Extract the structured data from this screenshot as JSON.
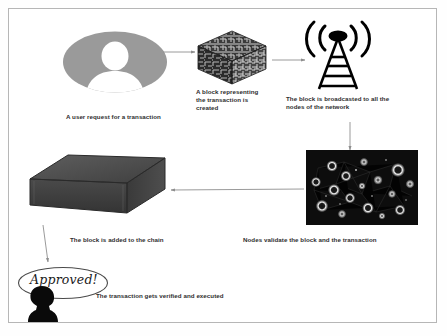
{
  "diagram": {
    "frame": {
      "border_color": "#b6b6b6",
      "background": "#ffffff"
    },
    "steps": [
      {
        "id": "user-request",
        "icon": "user-avatar-icon",
        "caption": "A user request for a transaction",
        "colors": {
          "disc": "#9a9a9a",
          "figure": "#ffffff"
        }
      },
      {
        "id": "block-created",
        "icon": "circuit-cube-icon",
        "caption": "A block representing\nthe transaction is\ncreated",
        "colors": {
          "dark": "#2b2b2b",
          "light": "#d0d0d0"
        }
      },
      {
        "id": "block-broadcasted",
        "icon": "radio-tower-icon",
        "caption": "The block is broadcasted to all the\nnodes of the network",
        "colors": {
          "tower": "#000000"
        }
      },
      {
        "id": "nodes-validate",
        "icon": "network-nodes-icon",
        "caption": "Nodes validate the block and the transaction",
        "colors": {
          "background": "#0d0d0d",
          "node_glow": "#e8e8e8"
        }
      },
      {
        "id": "block-added",
        "icon": "chain-block-icon",
        "caption": "The block is added to the chain",
        "colors": {
          "top": "#555555",
          "front": "#3c3c3c",
          "side": "#4a4a4a"
        }
      },
      {
        "id": "transaction-verified",
        "icon": "approved-bubble-icon",
        "caption": "The transaction gets verified and executed",
        "bubble_label": "Approved!",
        "colors": {
          "silhouette": "#0a0a0a",
          "bubble_stroke": "#4a4a4a"
        }
      }
    ],
    "arrows": [
      {
        "id": "arrow-user-to-block",
        "from": "user-request",
        "to": "block-created",
        "direction": "right"
      },
      {
        "id": "arrow-block-to-tower",
        "from": "block-created",
        "to": "block-broadcasted",
        "direction": "right"
      },
      {
        "id": "arrow-tower-to-nodes",
        "from": "block-broadcasted",
        "to": "nodes-validate",
        "direction": "down"
      },
      {
        "id": "arrow-nodes-to-chain",
        "from": "nodes-validate",
        "to": "block-added",
        "direction": "left"
      },
      {
        "id": "arrow-chain-to-approved",
        "from": "block-added",
        "to": "transaction-verified",
        "direction": "down"
      }
    ],
    "arrow_color": "#8e8e8e"
  }
}
